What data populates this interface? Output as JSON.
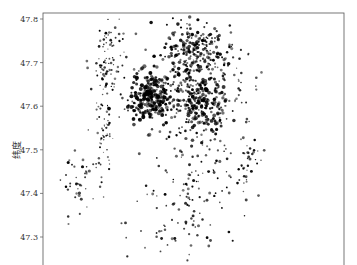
{
  "chart_data": {
    "type": "scatter",
    "title": "",
    "xlabel": "",
    "ylabel": "纬度",
    "ylim": [
      47.28,
      47.79
    ],
    "yticks": [
      47.8,
      47.7,
      47.6,
      47.5,
      47.4,
      47.3
    ],
    "ytick_labels": [
      "47.8",
      "47.7",
      "47.6",
      "47.5",
      "47.4",
      "47.3"
    ],
    "grid": false,
    "legend": null,
    "marker_color": "#000000",
    "clusters": [
      {
        "name": "north-central-dense",
        "cx": 0.5,
        "cy": 47.72,
        "sx": 0.055,
        "sy": 0.04,
        "n": 260,
        "size": 1.3
      },
      {
        "name": "central-dense-core",
        "cx": 0.36,
        "cy": 47.62,
        "sx": 0.035,
        "sy": 0.03,
        "n": 240,
        "size": 1.5
      },
      {
        "name": "east-central-dense",
        "cx": 0.52,
        "cy": 47.6,
        "sx": 0.05,
        "sy": 0.035,
        "n": 260,
        "size": 1.4
      },
      {
        "name": "northwest-strip",
        "cx": 0.22,
        "cy": 47.7,
        "sx": 0.03,
        "sy": 0.05,
        "n": 90,
        "size": 1.0
      },
      {
        "name": "west-coast-line",
        "cx": 0.2,
        "cy": 47.55,
        "sx": 0.02,
        "sy": 0.06,
        "n": 60,
        "size": 0.9
      },
      {
        "name": "southwest-cluster",
        "cx": 0.12,
        "cy": 47.42,
        "sx": 0.03,
        "sy": 0.03,
        "n": 40,
        "size": 1.2
      },
      {
        "name": "south-central-scatter",
        "cx": 0.48,
        "cy": 47.42,
        "sx": 0.09,
        "sy": 0.06,
        "n": 110,
        "size": 1.1
      },
      {
        "name": "east-cluster",
        "cx": 0.68,
        "cy": 47.48,
        "sx": 0.03,
        "sy": 0.03,
        "n": 35,
        "size": 1.1
      },
      {
        "name": "northeast-sparse",
        "cx": 0.62,
        "cy": 47.66,
        "sx": 0.05,
        "sy": 0.06,
        "n": 50,
        "size": 1.0
      },
      {
        "name": "south-sparse",
        "cx": 0.45,
        "cy": 47.31,
        "sx": 0.1,
        "sy": 0.025,
        "n": 30,
        "size": 1.1
      }
    ]
  },
  "header": {
    "cropped_title": "· · · · · · · · · · · · · ·"
  }
}
